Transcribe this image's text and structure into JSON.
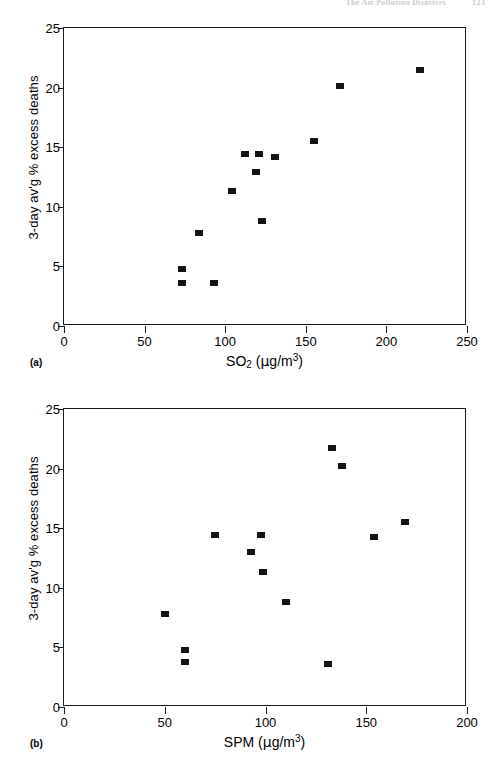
{
  "page_header": {
    "running_title": "The Air Pollution Disasters",
    "page_number": "123",
    "visible": "faint"
  },
  "figure": {
    "panels": [
      {
        "letter": "(a)",
        "y_axis_title": "3-day av'g % excess deaths",
        "x_axis_title_main": "SO",
        "x_axis_title_sub": "2",
        "x_axis_unit_open": " (",
        "x_axis_unit_mu": "µ",
        "x_axis_unit_gm": "g/m",
        "x_axis_unit_sup": "3",
        "x_axis_unit_close": ")",
        "x_ticks": [
          "0",
          "50",
          "100",
          "150",
          "200",
          "250"
        ],
        "y_ticks": [
          "0",
          "5",
          "10",
          "15",
          "20",
          "25"
        ]
      },
      {
        "letter": "(b)",
        "y_axis_title": "3-day av'g % excess deaths",
        "x_axis_title_main": "SPM",
        "x_axis_title_sub": "",
        "x_axis_unit_open": " (",
        "x_axis_unit_mu": "µ",
        "x_axis_unit_gm": "g/m",
        "x_axis_unit_sup": "3",
        "x_axis_unit_close": ")",
        "x_ticks": [
          "0",
          "50",
          "100",
          "150",
          "200"
        ],
        "y_ticks": [
          "0",
          "5",
          "10",
          "15",
          "20",
          "25"
        ]
      }
    ]
  },
  "chart_data": [
    {
      "type": "scatter",
      "panel": "(a)",
      "title": "",
      "xlabel": "SO2 (µg/m3)",
      "ylabel": "3-day av'g % excess deaths",
      "xlim": [
        0,
        250
      ],
      "ylim": [
        0,
        25
      ],
      "xticks": [
        0,
        50,
        100,
        150,
        200,
        250
      ],
      "yticks": [
        0,
        5,
        10,
        15,
        20,
        25
      ],
      "grid": false,
      "legend": "none",
      "marker": "filled-square",
      "marker_color": "#141414",
      "points": [
        {
          "x": 73,
          "y": 4.8
        },
        {
          "x": 73,
          "y": 3.6
        },
        {
          "x": 84,
          "y": 7.8
        },
        {
          "x": 93,
          "y": 3.6
        },
        {
          "x": 104,
          "y": 11.3
        },
        {
          "x": 112,
          "y": 14.4
        },
        {
          "x": 119,
          "y": 12.9
        },
        {
          "x": 121,
          "y": 14.4
        },
        {
          "x": 123,
          "y": 8.8
        },
        {
          "x": 131,
          "y": 14.2
        },
        {
          "x": 155,
          "y": 15.5
        },
        {
          "x": 171,
          "y": 20.1
        },
        {
          "x": 221,
          "y": 21.5
        }
      ]
    },
    {
      "type": "scatter",
      "panel": "(b)",
      "title": "",
      "xlabel": "SPM (µg/m3)",
      "ylabel": "3-day av'g % excess deaths",
      "xlim": [
        0,
        200
      ],
      "ylim": [
        0,
        25
      ],
      "xticks": [
        0,
        50,
        100,
        150,
        200
      ],
      "yticks": [
        0,
        5,
        10,
        15,
        20,
        25
      ],
      "grid": false,
      "legend": "none",
      "marker": "filled-square",
      "marker_color": "#141414",
      "points": [
        {
          "x": 50,
          "y": 7.8
        },
        {
          "x": 60,
          "y": 4.8
        },
        {
          "x": 60,
          "y": 3.8
        },
        {
          "x": 75,
          "y": 14.4
        },
        {
          "x": 93,
          "y": 13.0
        },
        {
          "x": 98,
          "y": 14.4
        },
        {
          "x": 99,
          "y": 11.3
        },
        {
          "x": 110,
          "y": 8.8
        },
        {
          "x": 131,
          "y": 3.6
        },
        {
          "x": 133,
          "y": 21.7
        },
        {
          "x": 138,
          "y": 20.2
        },
        {
          "x": 154,
          "y": 14.3
        },
        {
          "x": 169,
          "y": 15.5
        }
      ]
    }
  ]
}
